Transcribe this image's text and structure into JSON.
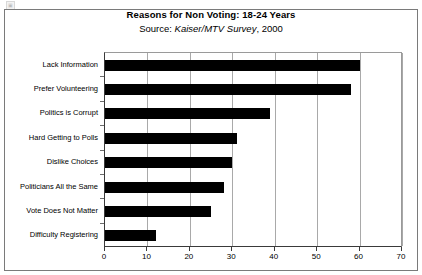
{
  "chart_data": {
    "type": "bar",
    "orientation": "horizontal",
    "title": "Reasons for Non Voting: 18-24 Years",
    "subtitle": {
      "label": "Source:",
      "source_name": "Kaiser/MTV Survey",
      "year": ", 2000"
    },
    "categories": [
      "Lack Information",
      "Prefer Volunteering",
      "Politics is Corrupt",
      "Hard Getting to Polls",
      "Dislike Choices",
      "Politicians All the Same",
      "Vote Does Not Matter",
      "Difficulty Registering"
    ],
    "values": [
      60,
      58,
      39,
      31,
      30,
      28,
      25,
      12
    ],
    "xlabel": "",
    "ylabel": "",
    "xlim": [
      0,
      70
    ],
    "xticks": [
      0,
      10,
      20,
      30,
      40,
      50,
      60,
      70
    ],
    "xtick_labels": [
      "0",
      "10",
      "20",
      "30",
      "40",
      "50",
      "60",
      "70"
    ],
    "grid": true,
    "grid_axis": "x",
    "legend": false,
    "bar_color": "#000000",
    "plot_background": "#ffffff",
    "frame_color": "#7a7a7a"
  },
  "artifact": {
    "corner_glyph": "▣"
  }
}
